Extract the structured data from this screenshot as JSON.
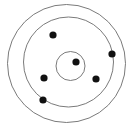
{
  "diagram": {
    "type": "atomic-orbital-schematic",
    "canvas": {
      "width": 134,
      "height": 128,
      "background": "#ffffff"
    },
    "style": {
      "ring_stroke_color": "#6b6b6b",
      "ring_stroke_width": 0.9,
      "electron_fill_color": "#111111"
    },
    "counts": {
      "shells": 3,
      "electrons_total": 6,
      "electrons_inner_shell": 1,
      "electrons_middle_shell": 3,
      "electrons_outer_shell": 2
    },
    "shells": [
      {
        "name": "inner-shell",
        "label": "K",
        "cx": 70.5,
        "cy": 66.0,
        "r": 14.5
      },
      {
        "name": "middle-shell",
        "label": "L",
        "cx": 68.5,
        "cy": 62.0,
        "r": 45.0
      },
      {
        "name": "outer-shell",
        "label": "M",
        "cx": 66.5,
        "cy": 63.5,
        "r": 59.0
      }
    ],
    "electrons": [
      {
        "name": "electron-inner-1",
        "shell": "inner-shell",
        "cx": 76.0,
        "cy": 62.0,
        "r": 3.6
      },
      {
        "name": "electron-middle-1",
        "shell": "middle-shell",
        "cx": 53.0,
        "cy": 35.0,
        "r": 3.6
      },
      {
        "name": "electron-middle-2",
        "shell": "middle-shell",
        "cx": 96.0,
        "cy": 79.0,
        "r": 3.6
      },
      {
        "name": "electron-middle-3",
        "shell": "middle-shell",
        "cx": 44.0,
        "cy": 78.0,
        "r": 3.6
      },
      {
        "name": "electron-outer-1",
        "shell": "outer-shell",
        "cx": 112.0,
        "cy": 54.0,
        "r": 3.6
      },
      {
        "name": "electron-outer-2",
        "shell": "outer-shell",
        "cx": 43.0,
        "cy": 100.0,
        "r": 3.6
      }
    ]
  }
}
